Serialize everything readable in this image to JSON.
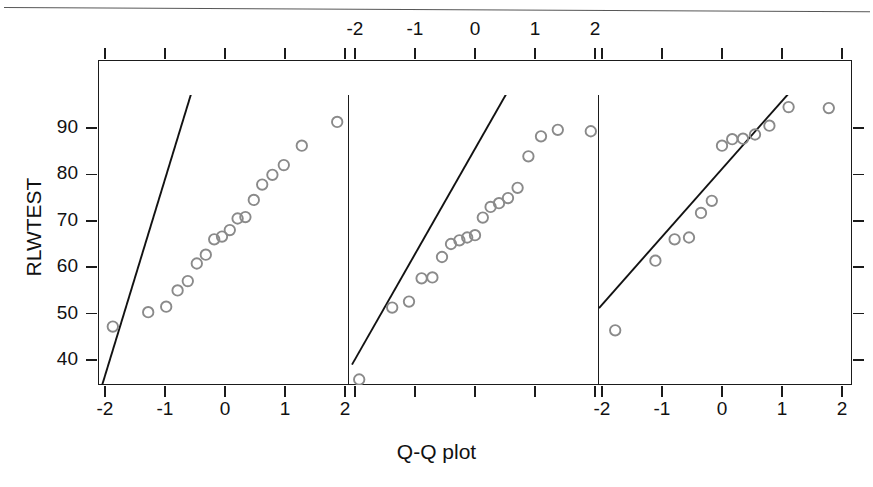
{
  "figure": {
    "x_axis_title": "Q-Q plot",
    "y_axis_title": "RLWTEST"
  },
  "panels": [
    {
      "label": "Non"
    },
    {
      "label": "Late"
    },
    {
      "label": "Early"
    }
  ],
  "axes": {
    "y_ticks": [
      "40",
      "50",
      "60",
      "70",
      "80",
      "90"
    ],
    "x_ticks": [
      "-2",
      "-1",
      "0",
      "1",
      "2"
    ],
    "top_labeled_panel": "Late",
    "bottom_labeled_panels": [
      "Non",
      "Early"
    ]
  },
  "chart_data": {
    "type": "scatter",
    "title": "",
    "xlabel": "Q-Q plot",
    "ylabel": "RLWTEST",
    "xlim": [
      -2.4,
      2.4
    ],
    "ylim": [
      34,
      98
    ],
    "grid": false,
    "legend": null,
    "facet_variable": "group",
    "facets": [
      {
        "name": "Non",
        "x": [
          -1.87,
          -1.28,
          -0.98,
          -0.79,
          -0.62,
          -0.47,
          -0.32,
          -0.18,
          -0.05,
          0.08,
          0.21,
          0.34,
          0.48,
          0.62,
          0.79,
          0.98,
          1.28,
          1.87
        ],
        "y": [
          47.2,
          50.3,
          51.5,
          55.0,
          57.0,
          60.8,
          62.7,
          66.0,
          66.6,
          68.0,
          70.5,
          70.8,
          74.5,
          77.8,
          79.9,
          82.0,
          86.2,
          91.3
        ],
        "reference_line": {
          "x": [
            -2.05,
            -0.55
          ],
          "y": [
            34.5,
            98.0
          ],
          "slope_note": "qq reference line"
        }
      },
      {
        "name": "Late",
        "x": [
          -1.93,
          -1.38,
          -1.1,
          -0.89,
          -0.71,
          -0.55,
          -0.4,
          -0.26,
          -0.13,
          0.0,
          0.13,
          0.26,
          0.4,
          0.55,
          0.71,
          0.89,
          1.1,
          1.38,
          1.93
        ],
        "y": [
          35.8,
          51.3,
          52.6,
          57.6,
          57.8,
          62.2,
          65.0,
          65.8,
          66.4,
          66.9,
          70.7,
          73.0,
          73.8,
          74.9,
          77.1,
          83.9,
          88.2,
          89.6,
          89.3
        ],
        "reference_line": {
          "x": [
            -2.05,
            0.55
          ],
          "y": [
            39.0,
            98.0
          ],
          "slope_note": "qq reference line"
        }
      },
      {
        "name": "Early",
        "x": [
          -1.78,
          -1.11,
          -0.79,
          -0.55,
          -0.35,
          -0.17,
          0.0,
          0.17,
          0.35,
          0.55,
          0.79,
          1.11,
          1.78
        ],
        "y": [
          46.4,
          61.4,
          66.0,
          66.4,
          71.7,
          74.3,
          86.2,
          87.6,
          87.7,
          88.6,
          90.5,
          94.5,
          94.3
        ],
        "reference_line": {
          "x": [
            -2.05,
            1.15
          ],
          "y": [
            51.2,
            98.0
          ],
          "slope_note": "qq reference line"
        }
      }
    ]
  }
}
